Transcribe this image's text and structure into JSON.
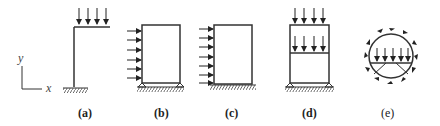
{
  "figure": {
    "axes": {
      "y_label": "y",
      "x_label": "x"
    },
    "panels": [
      {
        "id": "a",
        "label": "(a)",
        "description": "L-shaped column with fixed base, downward distributed load on cantilever beam"
      },
      {
        "id": "b",
        "label": "(b)",
        "description": "Portal frame with pinned supports, horizontal distributed load on left column"
      },
      {
        "id": "c",
        "label": "(c)",
        "description": "Portal frame with fixed base, horizontal distributed load on left column"
      },
      {
        "id": "d",
        "label": "(d)",
        "description": "Two-story frame with pinned supports, vertical loads on roof and floor"
      },
      {
        "id": "e",
        "label": "(e)",
        "description": "Circular ring with tangential shear loads, internal floor with vertical load and V-bracing"
      }
    ]
  }
}
